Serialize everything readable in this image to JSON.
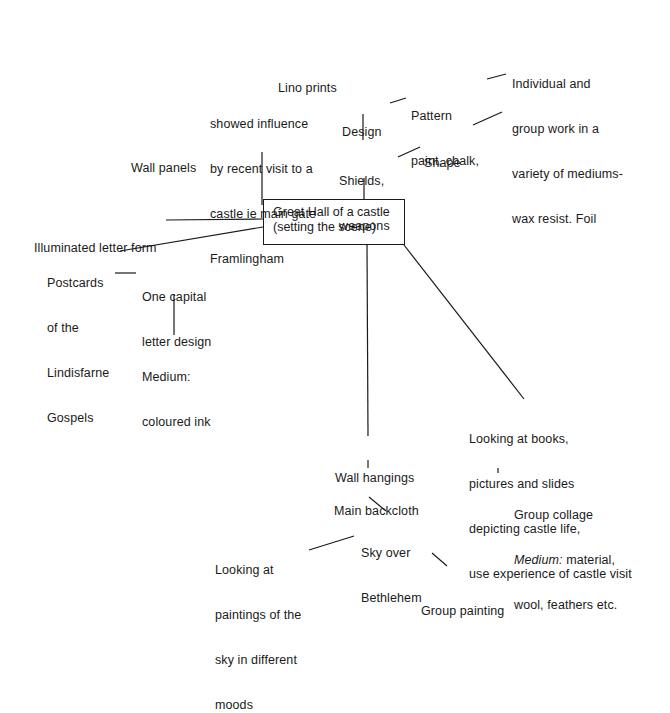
{
  "diagram": {
    "type": "mind-map",
    "center": {
      "lines": [
        "Great Hall of a castle",
        "(setting the scene)"
      ]
    },
    "nodes": {
      "lino_prints": {
        "lines": [
          "Lino prints"
        ]
      },
      "wall_panels": {
        "lines": [
          "Wall panels"
        ]
      },
      "showed_influence": {
        "lines": [
          "showed influence",
          "by recent visit to a",
          "castle ie main gate",
          "Framlingham"
        ]
      },
      "design": {
        "lines": [
          "Design"
        ]
      },
      "pattern": {
        "lines": [
          "Pattern",
          "paint, chalk,"
        ]
      },
      "individual_group": {
        "lines": [
          "Individual and",
          "group work in a",
          "variety of mediums-",
          "wax resist. Foil"
        ]
      },
      "shape": {
        "lines": [
          "Shape"
        ]
      },
      "shields": {
        "lines": [
          "Shields,",
          "weapons"
        ]
      },
      "illuminated": {
        "lines": [
          "Illuminated letter form"
        ]
      },
      "postcards": {
        "lines": [
          "Postcards",
          "of the",
          "Lindisfarne",
          "Gospels"
        ]
      },
      "one_capital": {
        "lines": [
          "One capital",
          "letter design"
        ]
      },
      "medium_ink": {
        "lines": [
          "Medium:",
          "coloured ink"
        ]
      },
      "looking_books": {
        "lines": [
          "Looking at books,",
          "pictures and slides",
          "depicting castle life,",
          "use experience of castle visit"
        ]
      },
      "group_collage": {
        "lines": [
          "Group collage"
        ],
        "medium_label": "Medium:",
        "medium_rest": " material,",
        "line3": "wool, feathers etc."
      },
      "wall_hangings": {
        "lines": [
          "Wall hangings"
        ]
      },
      "main_backcloth": {
        "lines": [
          "Main backcloth"
        ]
      },
      "sky_bethlehem": {
        "lines": [
          "Sky over",
          "Bethlehem"
        ]
      },
      "looking_paintings": {
        "lines": [
          "Looking at",
          "paintings of the",
          "sky in different",
          "moods"
        ]
      },
      "group_painting": {
        "lines": [
          "Group painting"
        ]
      }
    },
    "colors": {
      "ink": "#1a1a1a",
      "background": "#ffffff"
    }
  }
}
